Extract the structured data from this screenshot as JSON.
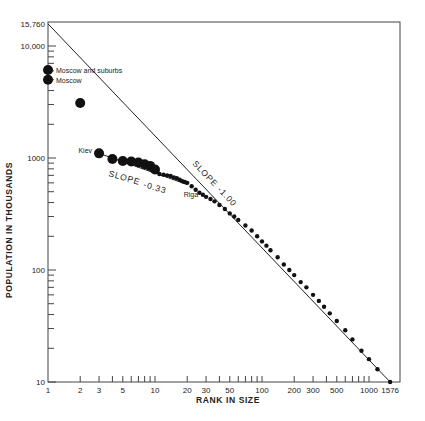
{
  "chart_data": {
    "type": "scatter",
    "title": "",
    "xlabel": "RANK IN SIZE",
    "ylabel": "POPULATION IN THOUSANDS",
    "xscale": "log",
    "yscale": "log",
    "xlim": [
      1,
      1576
    ],
    "ylim": [
      10,
      15760
    ],
    "grid": false,
    "legend": null,
    "x_tick_labels": [
      "1",
      "2",
      "3",
      "5",
      "10",
      "20",
      "30",
      "50",
      "100",
      "200",
      "300",
      "500",
      "1000",
      "1576"
    ],
    "x_tick_values": [
      1,
      2,
      3,
      5,
      10,
      20,
      30,
      50,
      100,
      200,
      300,
      500,
      1000,
      1576
    ],
    "y_tick_labels": [
      "10",
      "100",
      "1000",
      "10,000",
      "15,760"
    ],
    "y_tick_values": [
      10,
      100,
      1000,
      10000,
      15760
    ],
    "reference_line": {
      "label": "SLOPE -1.00",
      "label_display": [
        "SLOPE",
        "-1.00"
      ],
      "from": [
        1,
        15760
      ],
      "to": [
        1576,
        10
      ]
    },
    "fit_line": {
      "label": "SLOPE -0.33",
      "label_display": [
        "SLOPE",
        "-0.33"
      ],
      "from": [
        3,
        1100
      ],
      "to": [
        20,
        580
      ]
    },
    "annotations": [
      {
        "text": "Moscow and suburbs",
        "x": 1,
        "y": 6100
      },
      {
        "text": "Moscow",
        "x": 1,
        "y": 5000
      },
      {
        "text": "Kiev",
        "x": 3,
        "y": 1100
      },
      {
        "text": "Riga",
        "x": 22,
        "y": 560
      }
    ],
    "series": [
      {
        "name": "large-cities",
        "marker": "large-dot",
        "points": [
          [
            1,
            6100
          ],
          [
            1,
            5000
          ],
          [
            2,
            3100
          ],
          [
            3,
            1100
          ],
          [
            4,
            980
          ],
          [
            5,
            940
          ],
          [
            6,
            930
          ],
          [
            7,
            910
          ],
          [
            8,
            880
          ],
          [
            9,
            850
          ],
          [
            10,
            790
          ]
        ]
      },
      {
        "name": "cities",
        "marker": "small-dot",
        "points": [
          [
            11,
            720
          ],
          [
            12,
            710
          ],
          [
            13,
            700
          ],
          [
            14,
            690
          ],
          [
            15,
            670
          ],
          [
            16,
            660
          ],
          [
            17,
            640
          ],
          [
            18,
            620
          ],
          [
            19,
            610
          ],
          [
            20,
            600
          ],
          [
            22,
            560
          ],
          [
            24,
            520
          ],
          [
            26,
            490
          ],
          [
            28,
            470
          ],
          [
            30,
            450
          ],
          [
            33,
            430
          ],
          [
            36,
            410
          ],
          [
            40,
            380
          ],
          [
            45,
            350
          ],
          [
            50,
            320
          ],
          [
            55,
            300
          ],
          [
            60,
            280
          ],
          [
            70,
            250
          ],
          [
            80,
            225
          ],
          [
            90,
            200
          ],
          [
            100,
            180
          ],
          [
            110,
            165
          ],
          [
            120,
            150
          ],
          [
            140,
            130
          ],
          [
            160,
            112
          ],
          [
            180,
            100
          ],
          [
            200,
            90
          ],
          [
            230,
            78
          ],
          [
            260,
            70
          ],
          [
            300,
            60
          ],
          [
            340,
            53
          ],
          [
            380,
            47
          ],
          [
            430,
            41
          ],
          [
            500,
            35
          ],
          [
            600,
            29
          ],
          [
            700,
            24
          ],
          [
            850,
            19
          ],
          [
            1000,
            16
          ],
          [
            1200,
            13
          ],
          [
            1576,
            10
          ]
        ]
      }
    ]
  }
}
